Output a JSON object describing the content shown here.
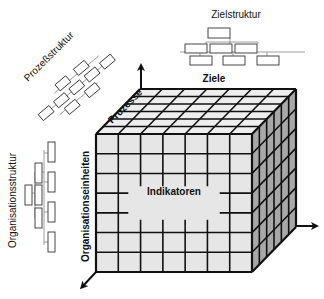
{
  "diagram": {
    "type": "3d-cube-matrix",
    "center_label": "Indikatoren",
    "axes": {
      "vertical_up": "Ziele",
      "depth": "Prozesse",
      "front_vertical": "Organisationseinheiten"
    },
    "structures": {
      "goals": {
        "title": "Zielstruktur",
        "levels": [
          1,
          3,
          3
        ]
      },
      "process": {
        "title": "Prozeßstruktur",
        "boxes": 9
      },
      "organization": {
        "title": "Organisationsstruktur",
        "levels": [
          1,
          3,
          4
        ]
      }
    },
    "grid": {
      "front_columns": 7,
      "front_rows": 7,
      "depth_divisions": 6
    },
    "colors": {
      "front_face": "#e6e6e6",
      "top_face": "#eeeeee",
      "side_face": "#a8a8a8",
      "lines": "#111111"
    }
  }
}
